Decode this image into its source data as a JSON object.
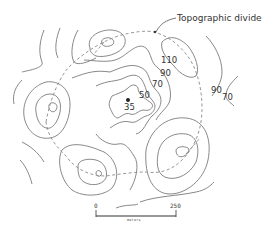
{
  "diagram": {
    "type": "topographic-contour-map",
    "annotation": "Topographic divide",
    "contour_labels": [
      {
        "value": "110",
        "x": 161,
        "y": 56
      },
      {
        "value": "90",
        "x": 160,
        "y": 69
      },
      {
        "value": "70",
        "x": 152,
        "y": 80
      },
      {
        "value": "50",
        "x": 139,
        "y": 91
      },
      {
        "value": "35",
        "x": 124,
        "y": 103
      },
      {
        "value": "90",
        "x": 211,
        "y": 86
      },
      {
        "value": "70",
        "x": 222,
        "y": 93
      }
    ],
    "low_point": {
      "label": "35",
      "marker": "dot"
    },
    "scale_bar": {
      "start": "0",
      "end": "250",
      "unit": "meters"
    },
    "colors": {
      "contour": "#7a7a7a",
      "divide": "#8a8a8a",
      "text": "#333333"
    }
  }
}
